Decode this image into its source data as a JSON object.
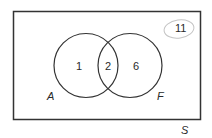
{
  "diagram": {
    "type": "venn",
    "universe": {
      "label": "S",
      "outside_count": "11"
    },
    "sets": [
      {
        "label": "A",
        "only_count": "1"
      },
      {
        "label": "F",
        "only_count": "6"
      }
    ],
    "intersection_count": "2",
    "colors": {
      "stroke": "#333333",
      "annotation": "#bdbdbd",
      "text": "#2a2a2a"
    }
  }
}
